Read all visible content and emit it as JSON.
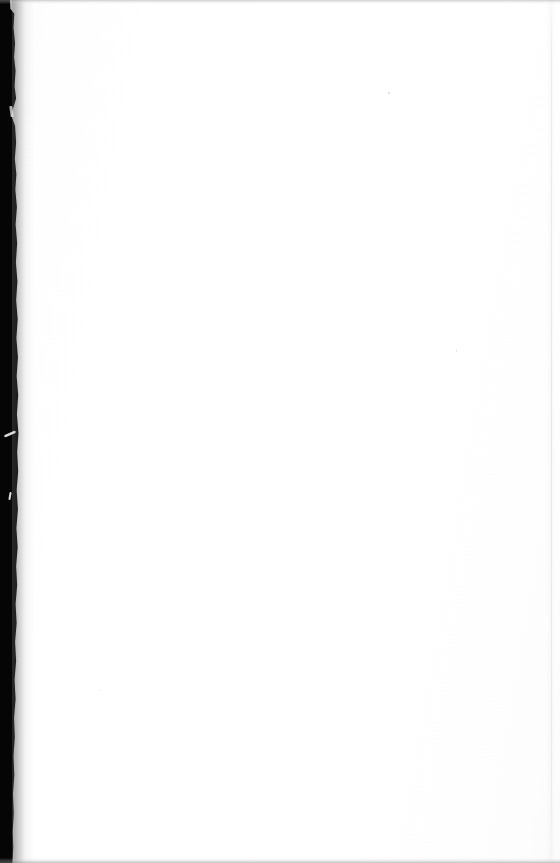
{
  "document": {
    "page_type": "blank-scanned-page",
    "page_text": "",
    "blank_note": ""
  },
  "scan": {
    "width": 560,
    "height": 863,
    "background_color": "#ffffff",
    "gutter_color": "#050505",
    "edge_band_color": "#969696",
    "page_edge_color": "#e6e6e6"
  },
  "artifacts": {
    "gutter_label": "",
    "scratch_upper_label": "",
    "scratch_lower_label": "",
    "scratch_notch_label": "",
    "speck_label": "",
    "edge_top_label": "",
    "edge_bottom_label": "",
    "page_edge_label": ""
  }
}
